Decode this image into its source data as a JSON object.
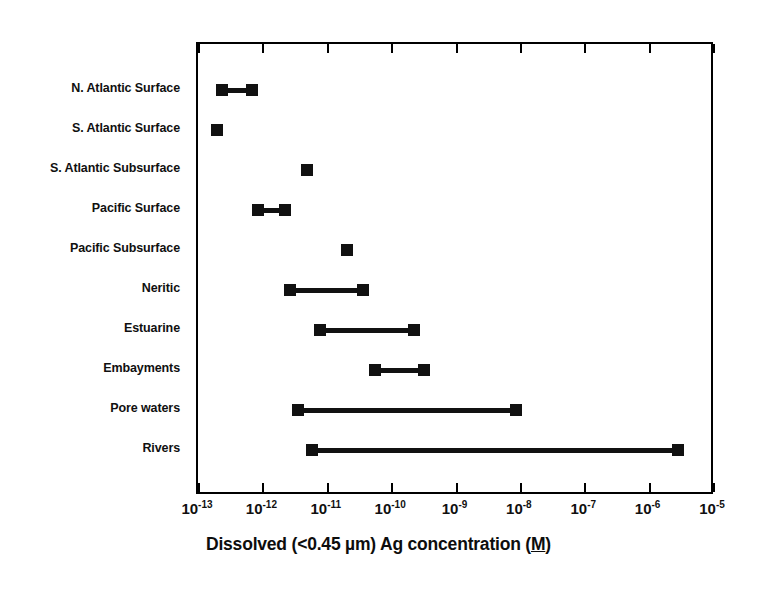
{
  "chart_data": {
    "type": "bar",
    "subtype": "range-dumbbell",
    "title": "",
    "xlabel": "Dissolved (<0.45 µm)  Ag concentration (M)",
    "ylabel": "",
    "xscale": "log",
    "xlim": [
      1e-13,
      1e-05
    ],
    "grid": false,
    "legend": null,
    "x_tick_values": [
      1e-13,
      1e-12,
      1e-11,
      1e-10,
      1e-09,
      1e-08,
      1e-07,
      1e-06,
      1e-05
    ],
    "x_tick_labels": [
      {
        "base": "10",
        "exponent": "-13"
      },
      {
        "base": "10",
        "exponent": "-12"
      },
      {
        "base": "10",
        "exponent": "-11"
      },
      {
        "base": "10",
        "exponent": "-10"
      },
      {
        "base": "10",
        "exponent": "-9"
      },
      {
        "base": "10",
        "exponent": "-8"
      },
      {
        "base": "10",
        "exponent": "-7"
      },
      {
        "base": "10",
        "exponent": "-6"
      },
      {
        "base": "10",
        "exponent": "-5"
      }
    ],
    "categories": [
      "N. Atlantic Surface",
      "S. Atlantic Surface",
      "S. Atlantic Subsurface",
      "Pacific Surface",
      "Pacific Subsurface",
      "Neritic",
      "Estuarine",
      "Embayments",
      "Pore waters",
      "Rivers"
    ],
    "ranges": [
      {
        "category": "N. Atlantic Surface",
        "low": 2.3e-13,
        "high": 6.6e-13
      },
      {
        "category": "S. Atlantic Surface",
        "low": 1.9e-13,
        "high": 1.9e-13
      },
      {
        "category": "S. Atlantic Subsurface",
        "low": 4.7e-12,
        "high": 4.7e-12
      },
      {
        "category": "Pacific Surface",
        "low": 8.2e-13,
        "high": 2.2e-12
      },
      {
        "category": "Pacific Subsurface",
        "low": 2e-11,
        "high": 2e-11
      },
      {
        "category": "Neritic",
        "low": 2.6e-12,
        "high": 3.5e-11
      },
      {
        "category": "Estuarine",
        "low": 7.7e-12,
        "high": 2.2e-10
      },
      {
        "category": "Embayments",
        "low": 5.5e-11,
        "high": 3.1e-10
      },
      {
        "category": "Pore waters",
        "low": 3.5e-12,
        "high": 8.5e-09
      },
      {
        "category": "Rivers",
        "low": 5.6e-12,
        "high": 2.8e-06
      }
    ],
    "colors": {
      "marker": "#111111",
      "line": "#111111",
      "axis": "#000000",
      "background": "#ffffff",
      "text": "#101010"
    }
  },
  "axis_title": {
    "part1": "Dissolved (<0.45 µm)  Ag concentration (",
    "part_m": "M",
    "part2": ")"
  }
}
